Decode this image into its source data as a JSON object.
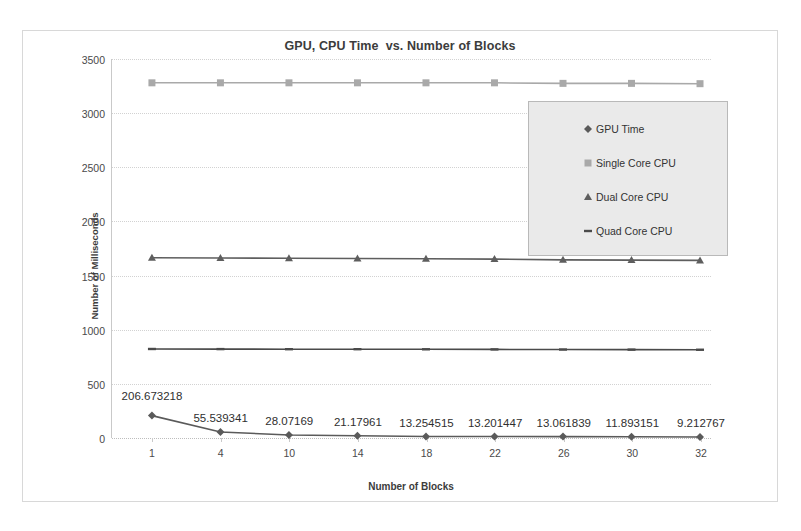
{
  "chart_data": {
    "type": "line",
    "title": "GPU, CPU Time  vs. Number of Blocks",
    "xlabel": "Number of Blocks",
    "ylabel": "Number of Milliseconds",
    "categories": [
      "1",
      "4",
      "10",
      "14",
      "18",
      "22",
      "26",
      "30",
      "32"
    ],
    "ylim": [
      0,
      3500
    ],
    "yticks": [
      "0",
      "500",
      "1000",
      "1500",
      "2000",
      "2500",
      "3000",
      "3500"
    ],
    "grid": true,
    "legend_position": "inside-right",
    "series": [
      {
        "name": "GPU Time",
        "marker": "diamond",
        "color": "#5a5a5a",
        "values": [
          206.673218,
          55.539341,
          28.07169,
          21.17961,
          13.254515,
          13.201447,
          13.061839,
          11.893151,
          9.212767
        ],
        "labels": [
          "206.673218",
          "55.539341",
          "28.07169",
          "21.17961",
          "13.254515",
          "13.201447",
          "13.061839",
          "11.893151",
          "9.212767"
        ]
      },
      {
        "name": "Single Core CPU",
        "marker": "square",
        "color": "#a9a9a9",
        "values": [
          3280,
          3280,
          3280,
          3280,
          3280,
          3280,
          3275,
          3275,
          3272
        ]
      },
      {
        "name": "Dual Core CPU",
        "marker": "triangle",
        "color": "#5e5e5e",
        "values": [
          1665,
          1662,
          1660,
          1658,
          1655,
          1652,
          1645,
          1643,
          1640
        ]
      },
      {
        "name": "Quad Core CPU",
        "marker": "line",
        "color": "#4a4a4a",
        "values": [
          822,
          821,
          820,
          820,
          819,
          818,
          817,
          816,
          815
        ]
      }
    ]
  },
  "legend": {
    "items": [
      {
        "label": "GPU Time",
        "marker": "diamond"
      },
      {
        "label": "Single Core CPU",
        "marker": "square"
      },
      {
        "label": "Dual Core CPU",
        "marker": "triangle"
      },
      {
        "label": "Quad Core CPU",
        "marker": "line"
      }
    ]
  }
}
